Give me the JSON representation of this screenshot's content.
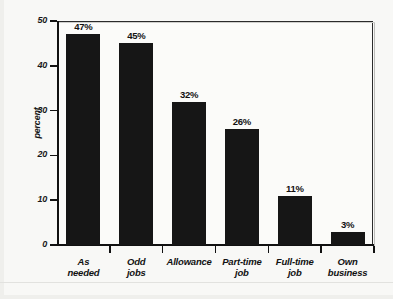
{
  "chart_data": {
    "type": "bar",
    "title": "",
    "subtitle": "",
    "xlabel": "",
    "ylabel": "percent",
    "ylim": [
      0,
      50
    ],
    "yticks": [
      0,
      10,
      20,
      30,
      40,
      50
    ],
    "ytick_labels": [
      "0",
      "10",
      "20",
      "30",
      "40",
      "50"
    ],
    "grid": false,
    "legend": "none",
    "bar_color": "#161616",
    "background_color": "#f8f8f6",
    "axis_color": "#111111",
    "categories": [
      "As\nneeded",
      "Odd\njobs",
      "Allowance",
      "Part-time\njob",
      "Full-time\njob",
      "Own\nbusiness"
    ],
    "values": [
      47,
      45,
      32,
      26,
      11,
      3
    ],
    "value_labels": [
      "47%",
      "45%",
      "32%",
      "26%",
      "11%",
      "3%"
    ]
  }
}
